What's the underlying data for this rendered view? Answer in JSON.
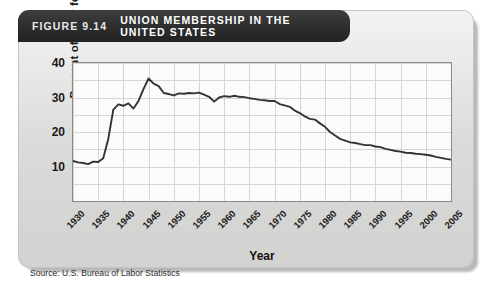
{
  "figure": {
    "number_label": "FIGURE 9.14",
    "title": "UNION MEMBERSHIP IN THE UNITED STATES",
    "source": "Source: U.S. Bureau of Labor Statistics"
  },
  "chart_data": {
    "type": "line",
    "title": "UNION MEMBERSHIP IN THE UNITED STATES",
    "subtitle": "",
    "xlabel": "Year",
    "ylabel": "Percent of labor force",
    "xlim": [
      1930,
      2005
    ],
    "ylim": [
      0,
      40
    ],
    "yticks": [
      10,
      20,
      30,
      40
    ],
    "xticks": [
      1930,
      1935,
      1940,
      1945,
      1950,
      1955,
      1960,
      1965,
      1970,
      1975,
      1980,
      1985,
      1990,
      1995,
      2000,
      2005
    ],
    "grid": true,
    "grid_x_step": 5,
    "grid_y_step": 5,
    "legend": null,
    "legend_position": "none",
    "line_color": "#333333",
    "series": [
      {
        "name": "Union membership",
        "units": "percent of labor force",
        "x": [
          1930,
          1931,
          1932,
          1933,
          1934,
          1935,
          1936,
          1937,
          1938,
          1939,
          1940,
          1941,
          1942,
          1943,
          1944,
          1945,
          1946,
          1947,
          1948,
          1949,
          1950,
          1951,
          1952,
          1953,
          1954,
          1955,
          1956,
          1957,
          1958,
          1959,
          1960,
          1961,
          1962,
          1963,
          1964,
          1965,
          1966,
          1967,
          1968,
          1969,
          1970,
          1971,
          1972,
          1973,
          1974,
          1975,
          1976,
          1977,
          1978,
          1979,
          1980,
          1981,
          1982,
          1983,
          1984,
          1985,
          1986,
          1987,
          1988,
          1989,
          1990,
          1991,
          1992,
          1993,
          1994,
          1995,
          1996,
          1997,
          1998,
          1999,
          2000,
          2001,
          2002,
          2003,
          2004,
          2005
        ],
        "values": [
          11.6,
          11.2,
          11.0,
          10.7,
          11.4,
          11.3,
          12.4,
          18.0,
          26.5,
          28.0,
          27.6,
          28.3,
          26.8,
          29.0,
          32.5,
          35.5,
          34.0,
          33.3,
          31.3,
          31.0,
          30.6,
          31.2,
          31.1,
          31.3,
          31.2,
          31.4,
          30.8,
          30.2,
          28.8,
          30.0,
          30.4,
          30.2,
          30.5,
          30.2,
          30.1,
          29.8,
          29.6,
          29.3,
          29.2,
          29.0,
          29.0,
          28.1,
          27.7,
          27.3,
          26.2,
          25.5,
          24.5,
          23.8,
          23.6,
          22.5,
          21.5,
          20.0,
          19.0,
          18.0,
          17.5,
          17.0,
          16.8,
          16.5,
          16.2,
          16.2,
          15.8,
          15.6,
          15.1,
          14.8,
          14.5,
          14.3,
          14.0,
          13.9,
          13.7,
          13.6,
          13.4,
          13.2,
          12.8,
          12.5,
          12.2,
          12.0
        ]
      }
    ]
  },
  "axis": {
    "ytick_labels": [
      "40",
      "30",
      "20",
      "10"
    ],
    "xtick_labels": [
      "1930",
      "1935",
      "1940",
      "1945",
      "1950",
      "1955",
      "1960",
      "1965",
      "1970",
      "1975",
      "1980",
      "1985",
      "1990",
      "1995",
      "2000",
      "2005"
    ],
    "ylabel_text": "Percent of labor force",
    "xlabel_text": "Year"
  },
  "colors": {
    "titlebar": "#2b2b2b",
    "panel": "#dcdcda",
    "plot_bg": "#fbfbfb",
    "line": "#333333",
    "grid": "#d5d5d5"
  }
}
